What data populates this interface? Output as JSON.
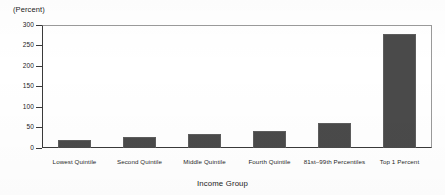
{
  "chart_data": {
    "type": "bar",
    "title": "",
    "xlabel": "Income Group",
    "ylabel": "(Percent)",
    "y_unit_label": "(Percent)",
    "categories": [
      "Lowest Quintile",
      "Second Quintile",
      "Middle Quintile",
      "Fourth Quintile",
      "81st–99th Percentiles",
      "Top 1 Percent"
    ],
    "values": [
      20,
      26,
      34,
      41,
      61,
      279
    ],
    "ylim": [
      0,
      300
    ],
    "yticks": [
      0,
      50,
      100,
      150,
      200,
      250,
      300
    ],
    "ytick_labels": [
      "0",
      "50",
      "100",
      "150",
      "200",
      "250",
      "300"
    ],
    "grid": false,
    "legend": "none",
    "bar_color": "#4a4a4a",
    "bar_edge_color": "#5d5d5d",
    "axis_color": "#3a3a3a",
    "background_color": "#ffffff"
  }
}
